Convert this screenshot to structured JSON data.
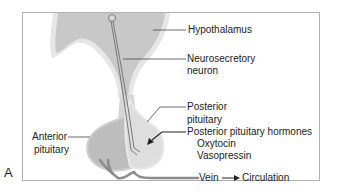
{
  "figure": {
    "panel_letter": "A",
    "colors": {
      "frame": "#b0b0b0",
      "hypothalamus_fill": "#c8c8c8",
      "outline_fill": "#e6e6e6",
      "anterior_fill": "#bdbdbd",
      "posterior_fill": "#dedede",
      "vein": "#8c8c8c",
      "neuron": "#777777",
      "text": "#222222"
    },
    "labels": {
      "hypothalamus": "Hypothalamus",
      "neurosecretory_line1": "Neurosecretory",
      "neurosecretory_line2": "neuron",
      "posterior_line1": "Posterior",
      "posterior_line2": "pituitary",
      "hormones_title": "Posterior pituitary hormones",
      "hormone_1": "Oxytocin",
      "hormone_2": "Vasopressin",
      "anterior_line1": "Anterior",
      "anterior_line2": "pituitary",
      "vein": "Vein",
      "circulation": "Circulation"
    }
  }
}
